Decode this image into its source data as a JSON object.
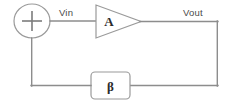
{
  "diagram": {
    "type": "feedback-control-block-diagram",
    "nodes": {
      "summing_junction": {
        "symbol": "+",
        "shape": "circle",
        "name": "summing-junction"
      },
      "amplifier": {
        "symbol": "A",
        "shape": "triangle",
        "name": "amplifier-block"
      },
      "feedback": {
        "symbol": "β",
        "shape": "rounded-rectangle",
        "name": "feedback-block"
      }
    },
    "labels": {
      "input": "Vin",
      "output": "Vout"
    },
    "colors": {
      "wire": "#8d8d8d",
      "outline": "#9a9a9a",
      "label_text": "#4a4a4a",
      "symbol_text": "#2b2b2b",
      "background": "#ffffff"
    }
  }
}
